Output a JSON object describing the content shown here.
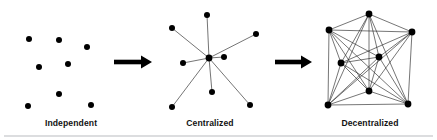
{
  "figure": {
    "background_color": "#ffffff",
    "width": 437,
    "height": 140,
    "node_color": "#000000",
    "edge_color": "#2b2b2b",
    "label_color": "#121212",
    "divider_color": "#b9bcc0"
  },
  "panels": [
    {
      "id": "independent",
      "label": "Independent",
      "label_x": 71,
      "label_y": 126,
      "node_radius": 3.0,
      "nodes": [
        {
          "id": "i1",
          "x": 29,
          "y": 39
        },
        {
          "id": "i2",
          "x": 59,
          "y": 40
        },
        {
          "id": "i3",
          "x": 87,
          "y": 47
        },
        {
          "id": "i4",
          "x": 39,
          "y": 67
        },
        {
          "id": "i5",
          "x": 68,
          "y": 64
        },
        {
          "id": "i6",
          "x": 59,
          "y": 94
        },
        {
          "id": "i7",
          "x": 28,
          "y": 106
        },
        {
          "id": "i8",
          "x": 91,
          "y": 105
        }
      ],
      "edges": []
    },
    {
      "id": "centralized",
      "label": "Centralized",
      "label_x": 210,
      "label_y": 126,
      "node_radius": 3.0,
      "hub_radius": 3.4,
      "hub": {
        "id": "hub",
        "x": 209,
        "y": 58
      },
      "nodes": [
        {
          "id": "c1",
          "x": 207,
          "y": 15
        },
        {
          "id": "c2",
          "x": 172,
          "y": 28
        },
        {
          "id": "c3",
          "x": 256,
          "y": 34
        },
        {
          "id": "c4",
          "x": 183,
          "y": 63
        },
        {
          "id": "c5",
          "x": 224,
          "y": 57
        },
        {
          "id": "c6",
          "x": 212,
          "y": 92
        },
        {
          "id": "c7",
          "x": 172,
          "y": 107
        },
        {
          "id": "c8",
          "x": 250,
          "y": 105
        }
      ],
      "edges": [
        [
          "hub",
          "c1"
        ],
        [
          "hub",
          "c2"
        ],
        [
          "hub",
          "c3"
        ],
        [
          "hub",
          "c4"
        ],
        [
          "hub",
          "c5"
        ],
        [
          "hub",
          "c6"
        ],
        [
          "hub",
          "c7"
        ],
        [
          "hub",
          "c8"
        ]
      ]
    },
    {
      "id": "decentralized",
      "label": "Decentralized",
      "label_x": 370,
      "label_y": 126,
      "node_radius": 3.4,
      "nodes": [
        {
          "id": "d1",
          "x": 369,
          "y": 14
        },
        {
          "id": "d2",
          "x": 329,
          "y": 30
        },
        {
          "id": "d3",
          "x": 412,
          "y": 32
        },
        {
          "id": "d4",
          "x": 341,
          "y": 63
        },
        {
          "id": "d5",
          "x": 379,
          "y": 57
        },
        {
          "id": "d6",
          "x": 369,
          "y": 91
        },
        {
          "id": "d7",
          "x": 328,
          "y": 105
        },
        {
          "id": "d8",
          "x": 408,
          "y": 104
        }
      ],
      "edges": [
        [
          "d1",
          "d2"
        ],
        [
          "d1",
          "d3"
        ],
        [
          "d1",
          "d4"
        ],
        [
          "d1",
          "d5"
        ],
        [
          "d1",
          "d6"
        ],
        [
          "d1",
          "d7"
        ],
        [
          "d1",
          "d8"
        ],
        [
          "d2",
          "d3"
        ],
        [
          "d2",
          "d4"
        ],
        [
          "d2",
          "d5"
        ],
        [
          "d2",
          "d6"
        ],
        [
          "d2",
          "d7"
        ],
        [
          "d2",
          "d8"
        ],
        [
          "d3",
          "d4"
        ],
        [
          "d3",
          "d5"
        ],
        [
          "d3",
          "d6"
        ],
        [
          "d3",
          "d7"
        ],
        [
          "d3",
          "d8"
        ],
        [
          "d4",
          "d5"
        ],
        [
          "d4",
          "d6"
        ],
        [
          "d4",
          "d7"
        ],
        [
          "d4",
          "d8"
        ],
        [
          "d5",
          "d6"
        ],
        [
          "d5",
          "d7"
        ],
        [
          "d5",
          "d8"
        ],
        [
          "d6",
          "d7"
        ],
        [
          "d6",
          "d8"
        ],
        [
          "d7",
          "d8"
        ]
      ]
    }
  ],
  "arrows": [
    {
      "id": "arrow-1",
      "x1": 114,
      "x2": 152,
      "y": 62,
      "shaft_height": 4.6,
      "head_width": 11,
      "head_height": 13
    },
    {
      "id": "arrow-2",
      "x1": 275,
      "x2": 312,
      "y": 62,
      "shaft_height": 4.6,
      "head_width": 11,
      "head_height": 13
    }
  ],
  "divider": {
    "x1": 4,
    "x2": 433,
    "y": 136
  }
}
